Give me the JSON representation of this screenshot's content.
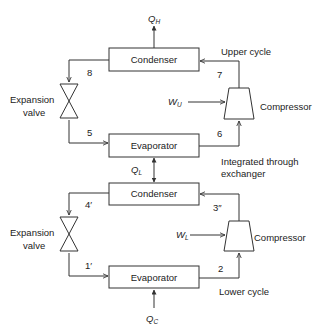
{
  "upper_cycle": {
    "label": "Upper cycle",
    "condenser": "Condenser",
    "evaporator": "Evaporator",
    "expansion_valve": [
      "Expansion",
      "valve"
    ],
    "compressor": "Compressor",
    "work": {
      "main": "W",
      "sub": "U"
    },
    "heat_out": {
      "main": "Q",
      "sub": "H"
    },
    "states": {
      "s8": "8",
      "s7": "7",
      "s5": "5",
      "s6": "6"
    }
  },
  "exchanger": {
    "label": [
      "Integrated through",
      "exchanger"
    ],
    "heat": {
      "main": "Q",
      "sub": "L"
    }
  },
  "lower_cycle": {
    "label": "Lower cycle",
    "condenser": "Condenser",
    "evaporator": "Evaporator",
    "expansion_valve": [
      "Expansion",
      "valve"
    ],
    "compressor": "Compressor",
    "work": {
      "main": "W",
      "sub": "L"
    },
    "heat_in": {
      "main": "Q",
      "sub": "C"
    },
    "states": {
      "s4": "4′",
      "s3": "3″",
      "s1": "1′",
      "s2": "2"
    }
  }
}
